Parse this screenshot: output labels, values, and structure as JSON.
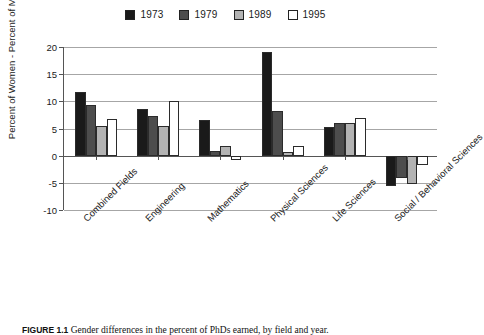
{
  "figure": {
    "caption_number": "FIGURE 1.1",
    "caption_text": "Gender differences in the percent of PhDs earned, by field and year."
  },
  "legend": {
    "position": "top-center",
    "entries": [
      {
        "label": "1973",
        "color": "#1a1a1a"
      },
      {
        "label": "1979",
        "color": "#4d4d4d"
      },
      {
        "label": "1989",
        "color": "#b3b3b3"
      },
      {
        "label": "1995",
        "color": "#ffffff"
      }
    ]
  },
  "axis": {
    "y_title": "Percent of Women - Percent of Men",
    "y_ticks": [
      "20",
      "15",
      "10",
      "5",
      "0",
      "-5",
      "-10"
    ]
  },
  "chart_data": {
    "type": "bar",
    "title": "",
    "xlabel": "",
    "ylabel": "Percent of Women - Percent of Men",
    "ylim": [
      -10,
      20
    ],
    "ytick_step": 5,
    "grid": true,
    "legend_position": "top-center",
    "categories": [
      "Combined Fields",
      "Engineering",
      "Mathematics",
      "Physical Sciences",
      "Life Sciences",
      "Social / Behavioral Sciences"
    ],
    "series": [
      {
        "name": "1973",
        "color": "#1a1a1a",
        "values": [
          11.8,
          8.5,
          6.5,
          19.0,
          5.2,
          -5.6
        ]
      },
      {
        "name": "1979",
        "color": "#4d4d4d",
        "values": [
          9.3,
          7.3,
          0.8,
          8.2,
          6.1,
          -4.2
        ]
      },
      {
        "name": "1989",
        "color": "#b3b3b3",
        "values": [
          5.4,
          5.5,
          1.8,
          0.6,
          6.1,
          -5.3
        ]
      },
      {
        "name": "1995",
        "color": "#ffffff",
        "values": [
          6.7,
          10.0,
          -0.8,
          1.8,
          6.9,
          -1.8
        ]
      }
    ]
  }
}
